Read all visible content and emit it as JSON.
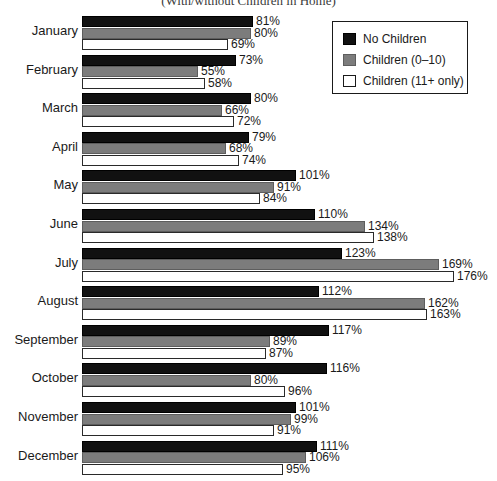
{
  "chart_data": {
    "type": "bar",
    "orientation": "horizontal",
    "title": "(With/without Children in Home)",
    "subtitle": "(With/without Children in Home)",
    "xlabel": "",
    "ylabel": "",
    "grid": false,
    "legend_position": "top-right",
    "xlim": [
      0,
      176
    ],
    "value_suffix": "%",
    "categories": [
      "January",
      "February",
      "March",
      "April",
      "May",
      "June",
      "July",
      "August",
      "September",
      "October",
      "November",
      "December"
    ],
    "series": [
      {
        "name": "No Children",
        "color": "#111111",
        "values": [
          81,
          73,
          80,
          79,
          101,
          110,
          123,
          112,
          117,
          116,
          101,
          111
        ],
        "labels": [
          "81%",
          "73%",
          "80%",
          "79%",
          "101%",
          "110%",
          "123%",
          "112%",
          "117%",
          "116%",
          "101%",
          "111%"
        ]
      },
      {
        "name": "Children (0–10)",
        "color": "#7c7c7c",
        "values": [
          80,
          55,
          66,
          68,
          91,
          134,
          169,
          162,
          89,
          80,
          99,
          106
        ],
        "labels": [
          "80%",
          "55%",
          "66%",
          "68%",
          "91%",
          "134%",
          "169%",
          "162%",
          "89%",
          "80%",
          "99%",
          "106%"
        ]
      },
      {
        "name": "Children (11+ only)",
        "color": "#ffffff",
        "values": [
          69,
          58,
          72,
          74,
          84,
          138,
          176,
          163,
          87,
          96,
          91,
          95
        ],
        "labels": [
          "69%",
          "58%",
          "72%",
          "74%",
          "84%",
          "138%",
          "176%",
          "163%",
          "87%",
          "96%",
          "91%",
          "95%"
        ]
      }
    ]
  },
  "legend": {
    "items": [
      {
        "label": "No Children",
        "swatch": "black-swatch"
      },
      {
        "label": "Children (0–10)",
        "swatch": "gray-swatch"
      },
      {
        "label": "Children (11+ only)",
        "swatch": "white-swatch"
      }
    ]
  }
}
